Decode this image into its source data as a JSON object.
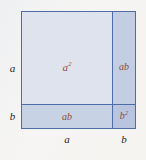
{
  "figure": {
    "kind": "algebraic-identity-area-diagram",
    "identity": "(a + b)^2 = a^2 + 2ab + b^2",
    "background_color": "#f5f4f2",
    "border_color": "#4e6ca6",
    "area_label_color": "#8d4b39",
    "edge_label_color": "#27272a"
  },
  "regions": [
    {
      "id": "a-squared",
      "label_base": "a",
      "label_exponent": "2",
      "fill": "#dee3ee",
      "width_term": "a",
      "height_term": "a"
    },
    {
      "id": "ab-right",
      "label_base": "ab",
      "label_exponent": "",
      "fill": "#c4cee3",
      "width_term": "b",
      "height_term": "a"
    },
    {
      "id": "ab-bottom",
      "label_base": "ab",
      "label_exponent": "",
      "fill": "#c8d2e5",
      "width_term": "a",
      "height_term": "b"
    },
    {
      "id": "b-squared",
      "label_base": "b",
      "label_exponent": "2",
      "fill": "#b9c5de",
      "width_term": "b",
      "height_term": "b"
    }
  ],
  "edge_labels": {
    "left_upper": "a",
    "left_lower": "b",
    "bottom_left": "a",
    "bottom_right": "b"
  }
}
